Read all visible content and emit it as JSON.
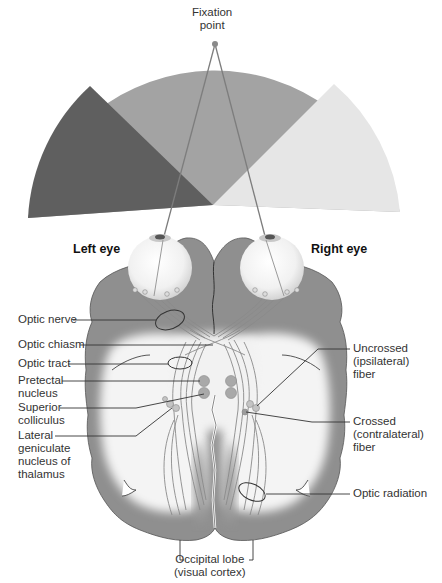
{
  "figure": {
    "fixation_label": [
      "Fixation",
      "point"
    ],
    "eye_labels": {
      "left": "Left eye",
      "right": "Right eye"
    },
    "visual_field_colors": {
      "left_only": "#5f5f5f",
      "binocular": "#a3a3a3",
      "right_only": "#e6e6e6"
    },
    "brain_colors": {
      "gray_matter": "#8f8f8f",
      "white_matter": "#f4f4f4",
      "pathway_fill": "#e2e2e2",
      "pathway_stroke": "#8a8a8a",
      "nucleus": "#a9a9a9"
    },
    "left_labels": [
      {
        "id": "optic-nerve",
        "lines": [
          "Optic nerve"
        ]
      },
      {
        "id": "optic-chiasm",
        "lines": [
          "Optic chiasm"
        ]
      },
      {
        "id": "optic-tract",
        "lines": [
          "Optic tract"
        ]
      },
      {
        "id": "pretectal-nucleus",
        "lines": [
          "Pretectal",
          "nucleus"
        ]
      },
      {
        "id": "superior-colliculus",
        "lines": [
          "Superior",
          "colliculus"
        ]
      },
      {
        "id": "lateral-geniculate-nucleus",
        "lines": [
          "Lateral",
          "geniculate",
          "nucleus of",
          "thalamus"
        ]
      }
    ],
    "right_labels": [
      {
        "id": "uncrossed-fiber",
        "lines": [
          "Uncrossed",
          "(ipsilateral)",
          "fiber"
        ]
      },
      {
        "id": "crossed-fiber",
        "lines": [
          "Crossed",
          "(contralateral)",
          "fiber"
        ]
      },
      {
        "id": "optic-radiation",
        "lines": [
          "Optic radiation"
        ]
      }
    ],
    "bottom_label": {
      "id": "occipital-lobe",
      "lines": [
        "Occipital lobe",
        "(visual cortex)"
      ]
    }
  }
}
